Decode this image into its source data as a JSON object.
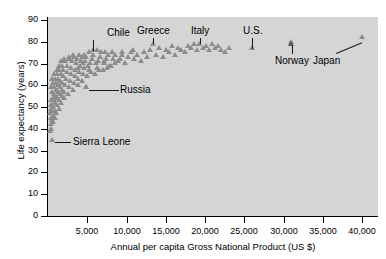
{
  "chart_data": {
    "type": "scatter",
    "title": "",
    "xlabel": "Annual per capita Gross National Product (US $)",
    "ylabel": "Life expectancy (years)",
    "xlim": [
      0,
      42000
    ],
    "ylim": [
      0,
      90
    ],
    "xticks": [
      5000,
      10000,
      15000,
      20000,
      25000,
      30000,
      35000,
      40000
    ],
    "xtick_labels": [
      "5,000",
      "10,000",
      "15,000",
      "20,000",
      "25,000",
      "30,000",
      "35,000",
      "40,000"
    ],
    "yticks": [
      0,
      10,
      20,
      30,
      40,
      50,
      60,
      70,
      80,
      90
    ],
    "ytick_labels": [
      "0",
      "10",
      "20",
      "30",
      "40",
      "50",
      "60",
      "70",
      "80",
      "90"
    ],
    "grid": false,
    "legend": "none",
    "marker": "triangle",
    "marker_color": "#8c8c8c",
    "panel_color": "#d5d5d5",
    "annotations": [
      {
        "label": "Chile",
        "point_x": 5700,
        "point_y": 75,
        "label_x": 9000,
        "label_y": 84,
        "leader": "vertical"
      },
      {
        "label": "Greece",
        "point_x": 13400,
        "point_y": 78,
        "label_x": 13400,
        "label_y": 85,
        "leader": "vertical"
      },
      {
        "label": "Italy",
        "point_x": 19300,
        "point_y": 78,
        "label_x": 19300,
        "label_y": 85,
        "leader": "vertical"
      },
      {
        "label": "U.S.",
        "point_x": 26000,
        "point_y": 76,
        "label_x": 26000,
        "label_y": 85,
        "leader": "vertical"
      },
      {
        "label": "Norway",
        "point_x": 31000,
        "point_y": 79,
        "label_x": 31000,
        "label_y": 71,
        "leader": "vertical-up"
      },
      {
        "label": "Japan",
        "point_x": 40000,
        "point_y": 81,
        "label_x": 35500,
        "label_y": 71,
        "leader": "diagonal"
      },
      {
        "label": "Russia",
        "point_x": 4800,
        "point_y": 58,
        "label_x": 9200,
        "label_y": 58,
        "leader": "horizontal"
      },
      {
        "label": "Sierra Leone",
        "point_x": 500,
        "point_y": 34,
        "label_x": 3200,
        "label_y": 34,
        "leader": "horizontal"
      }
    ],
    "points": [
      [
        320,
        38
      ],
      [
        360,
        41
      ],
      [
        400,
        44
      ],
      [
        300,
        46
      ],
      [
        420,
        48
      ],
      [
        380,
        50
      ],
      [
        340,
        52
      ],
      [
        460,
        39
      ],
      [
        500,
        43
      ],
      [
        520,
        47
      ],
      [
        560,
        50
      ],
      [
        600,
        53
      ],
      [
        480,
        56
      ],
      [
        440,
        58
      ],
      [
        640,
        42
      ],
      [
        680,
        45
      ],
      [
        700,
        49
      ],
      [
        720,
        52
      ],
      [
        760,
        55
      ],
      [
        800,
        58
      ],
      [
        640,
        60
      ],
      [
        580,
        62
      ],
      [
        860,
        44
      ],
      [
        900,
        47
      ],
      [
        940,
        51
      ],
      [
        980,
        54
      ],
      [
        1020,
        57
      ],
      [
        1060,
        60
      ],
      [
        880,
        62
      ],
      [
        820,
        64
      ],
      [
        1100,
        46
      ],
      [
        1150,
        50
      ],
      [
        1200,
        53
      ],
      [
        1250,
        56
      ],
      [
        1300,
        59
      ],
      [
        1350,
        62
      ],
      [
        1180,
        64
      ],
      [
        1120,
        66
      ],
      [
        1400,
        48
      ],
      [
        1450,
        52
      ],
      [
        1500,
        55
      ],
      [
        1550,
        58
      ],
      [
        1600,
        61
      ],
      [
        1650,
        64
      ],
      [
        1480,
        66
      ],
      [
        1420,
        68
      ],
      [
        1700,
        51
      ],
      [
        1750,
        54
      ],
      [
        1800,
        57
      ],
      [
        1850,
        60
      ],
      [
        1900,
        63
      ],
      [
        1950,
        66
      ],
      [
        1780,
        68
      ],
      [
        1720,
        70
      ],
      [
        2000,
        53
      ],
      [
        2100,
        56
      ],
      [
        2200,
        59
      ],
      [
        2300,
        62
      ],
      [
        2400,
        65
      ],
      [
        2500,
        68
      ],
      [
        2150,
        70
      ],
      [
        2050,
        71
      ],
      [
        2600,
        55
      ],
      [
        2700,
        58
      ],
      [
        2800,
        61
      ],
      [
        2900,
        64
      ],
      [
        3000,
        67
      ],
      [
        3100,
        70
      ],
      [
        2750,
        71
      ],
      [
        2650,
        72
      ],
      [
        3200,
        57
      ],
      [
        3300,
        60
      ],
      [
        3400,
        63
      ],
      [
        3500,
        66
      ],
      [
        3600,
        69
      ],
      [
        3700,
        71
      ],
      [
        3350,
        72
      ],
      [
        3250,
        73
      ],
      [
        3800,
        59
      ],
      [
        3900,
        62
      ],
      [
        4000,
        65
      ],
      [
        4100,
        68
      ],
      [
        4200,
        70
      ],
      [
        4300,
        72
      ],
      [
        3950,
        73
      ],
      [
        3850,
        67
      ],
      [
        4400,
        61
      ],
      [
        4500,
        64
      ],
      [
        4600,
        67
      ],
      [
        4700,
        70
      ],
      [
        4800,
        58
      ],
      [
        4900,
        72
      ],
      [
        4550,
        73
      ],
      [
        4450,
        69
      ],
      [
        5000,
        63
      ],
      [
        5200,
        66
      ],
      [
        5400,
        69
      ],
      [
        5600,
        71
      ],
      [
        5800,
        73
      ],
      [
        5300,
        74
      ],
      [
        5100,
        68
      ],
      [
        5500,
        65
      ],
      [
        6000,
        64
      ],
      [
        6200,
        67
      ],
      [
        6400,
        70
      ],
      [
        6600,
        72
      ],
      [
        6800,
        74
      ],
      [
        6300,
        75
      ],
      [
        6100,
        69
      ],
      [
        6500,
        66
      ],
      [
        7000,
        66
      ],
      [
        7200,
        69
      ],
      [
        7400,
        71
      ],
      [
        7600,
        73
      ],
      [
        7800,
        68
      ],
      [
        7300,
        74
      ],
      [
        7100,
        70
      ],
      [
        7500,
        67
      ],
      [
        8000,
        68
      ],
      [
        8300,
        71
      ],
      [
        8600,
        73
      ],
      [
        8900,
        70
      ],
      [
        8200,
        74
      ],
      [
        8500,
        69
      ],
      [
        9200,
        71
      ],
      [
        9500,
        73
      ],
      [
        9800,
        69
      ],
      [
        9400,
        74
      ],
      [
        10200,
        72
      ],
      [
        10600,
        74
      ],
      [
        11000,
        71
      ],
      [
        10800,
        75
      ],
      [
        11400,
        73
      ],
      [
        11800,
        70
      ],
      [
        12200,
        74
      ],
      [
        12600,
        72
      ],
      [
        13000,
        75
      ],
      [
        13400,
        78
      ],
      [
        13800,
        73
      ],
      [
        14200,
        76
      ],
      [
        14600,
        72
      ],
      [
        15000,
        75
      ],
      [
        15400,
        74
      ],
      [
        15800,
        77
      ],
      [
        16200,
        73
      ],
      [
        16600,
        76
      ],
      [
        17000,
        75
      ],
      [
        17400,
        74
      ],
      [
        17800,
        77
      ],
      [
        18200,
        76
      ],
      [
        18600,
        78
      ],
      [
        19000,
        75
      ],
      [
        19300,
        78
      ],
      [
        19700,
        76
      ],
      [
        20100,
        77
      ],
      [
        20500,
        75
      ],
      [
        20900,
        78
      ],
      [
        21300,
        76
      ],
      [
        21700,
        77
      ],
      [
        22100,
        75
      ],
      [
        22500,
        74
      ],
      [
        23000,
        76
      ],
      [
        26000,
        76
      ],
      [
        31000,
        79
      ],
      [
        40000,
        81
      ],
      [
        5700,
        75
      ],
      [
        4800,
        58
      ],
      [
        500,
        34
      ]
    ]
  }
}
